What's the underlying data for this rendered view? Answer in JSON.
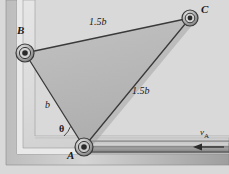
{
  "figure": {
    "type": "mechanics-linkage-diagram",
    "background_color": "#d9d9d9",
    "body_fill_color": "#b9b9b9",
    "outline_color": "#3a3a3a",
    "labels": {
      "point_a": "A",
      "point_b": "B",
      "point_c": "C",
      "side_bc": "1.5b",
      "side_ac": "1.5b",
      "side_ab": "b",
      "angle": "θ",
      "velocity_symbol": "v",
      "velocity_subscript": "A"
    },
    "geometry": {
      "pin_b": {
        "x": 25,
        "y": 53
      },
      "pin_a": {
        "x": 84,
        "y": 147
      },
      "pin_c": {
        "x": 190,
        "y": 18
      }
    },
    "annotations": {
      "arrow_direction": "left",
      "arrow_meaning": "velocity of slider A"
    }
  }
}
